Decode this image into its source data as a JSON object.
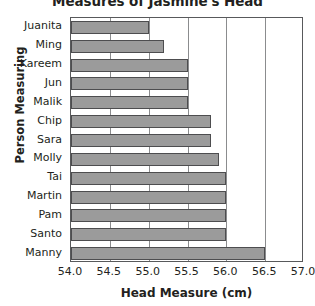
{
  "chart_data": {
    "type": "bar",
    "orientation": "horizontal",
    "title": "Measures of Jasmine's Head",
    "xlabel": "Head Measure (cm)",
    "ylabel": "Person Measuring",
    "categories": [
      "Juanita",
      "Ming",
      "Kareem",
      "Jun",
      "Malik",
      "Chip",
      "Sara",
      "Molly",
      "Tai",
      "Martin",
      "Pam",
      "Santo",
      "Manny"
    ],
    "values": [
      55.0,
      55.2,
      55.5,
      55.5,
      55.5,
      55.8,
      55.8,
      55.9,
      56.0,
      56.0,
      56.0,
      56.0,
      56.5
    ],
    "xlim": [
      54.0,
      57.0
    ],
    "xticks": [
      54.0,
      54.5,
      55.0,
      55.5,
      56.0,
      56.5,
      57.0
    ],
    "xtick_labels": [
      "54.0",
      "54.5",
      "55.0",
      "55.5",
      "56.0",
      "56.5",
      "57.0"
    ],
    "grid": "vertical",
    "legend": "none",
    "bar_color": "#9b9b9b",
    "bar_edge_color": "#4d4d4f",
    "axis_color": "#58595b",
    "gridline_color": "#8b8c8e",
    "text_color": "#231f20"
  }
}
